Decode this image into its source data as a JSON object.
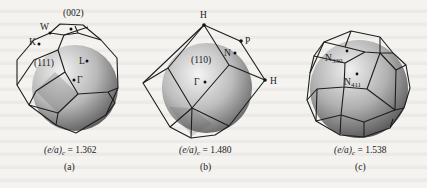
{
  "figure": {
    "panels": [
      {
        "id": "a",
        "caption": "(a)",
        "formula": {
          "lhs": "(e/a)",
          "subscript": "c",
          "equals": "= 1.362"
        },
        "labels": {
          "face_002": "(002)",
          "face_111": "(111)",
          "point_W": "W",
          "point_K": "K",
          "point_X": "X",
          "point_L": "L",
          "point_Gamma": "Γ"
        }
      },
      {
        "id": "b",
        "caption": "(b)",
        "formula": {
          "lhs": "(e/a)",
          "subscript": "c",
          "equals": "= 1.480"
        },
        "labels": {
          "point_H_top": "H",
          "point_H_right": "H",
          "point_P": "P",
          "point_N": "N",
          "face_110": "(110)",
          "point_Gamma": "Γ"
        }
      },
      {
        "id": "c",
        "caption": "(c)",
        "formula": {
          "lhs": "(e/a)",
          "subscript": "c",
          "equals": "= 1.538"
        },
        "labels": {
          "point_N330": "N",
          "point_N330_sub": "330",
          "point_N411": "N",
          "point_N411_sub": "411"
        }
      }
    ],
    "colors": {
      "sphere_light": "#e6e6e6",
      "sphere_dark": "#6e6e6e",
      "edges": "#1e1e1e",
      "background": "#f4f3f0"
    }
  }
}
